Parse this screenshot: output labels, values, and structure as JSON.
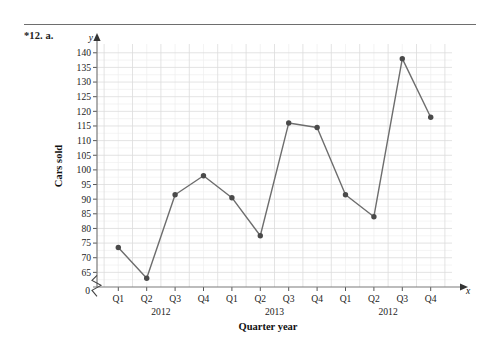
{
  "exercise_label": "*12. a.",
  "chart_data": {
    "type": "line",
    "title": "",
    "xlabel": "Quarter year",
    "ylabel": "Cars sold",
    "x_axis_letter": "x",
    "y_axis_letter": "y",
    "categories": [
      "Q1",
      "Q2",
      "Q3",
      "Q4",
      "Q1",
      "Q2",
      "Q3",
      "Q4",
      "Q1",
      "Q2",
      "Q3",
      "Q4"
    ],
    "group_labels": [
      "2012",
      "2013",
      "2012"
    ],
    "values": [
      73.5,
      63,
      91.5,
      98,
      90.5,
      77.5,
      116,
      114.5,
      91.5,
      84,
      138,
      118
    ],
    "ylim": [
      60,
      143
    ],
    "y_ticks": [
      65,
      70,
      75,
      80,
      85,
      90,
      95,
      100,
      105,
      110,
      115,
      120,
      125,
      130,
      135,
      140
    ],
    "y_origin_label": "0",
    "axis_break": true,
    "grid": true,
    "legend": "none",
    "line_color": "#6d6d6d",
    "marker_color": "#4a4a4a",
    "grid_color": "#dcdcdc",
    "minor_grid_color": "#efefef",
    "axis_color": "#7a7a7a"
  }
}
